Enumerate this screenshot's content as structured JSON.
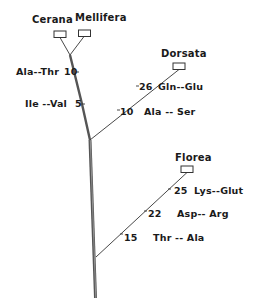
{
  "species": {
    "cerana": "Cerana",
    "mellifera": "Mellifera",
    "dorsata": "Dorsata",
    "florea": "Florea"
  },
  "substitutions": {
    "trunk": [
      {
        "position": "10",
        "change": "Ala--Thr"
      },
      {
        "position": "5",
        "change": "Ile --Val"
      }
    ],
    "dorsata": [
      {
        "position": "26",
        "change": "Gln--Glu"
      },
      {
        "position": "10",
        "change": "Ala -- Ser"
      }
    ],
    "florea": [
      {
        "position": "25",
        "change": "Lys--Glut"
      },
      {
        "position": "22",
        "change": "Asp-- Arg"
      },
      {
        "position": "15",
        "change": "Thr -- Ala"
      }
    ]
  },
  "colors": {
    "line": "#3a3a3a",
    "trunk": "#555555",
    "text": "#1a1a1a"
  }
}
